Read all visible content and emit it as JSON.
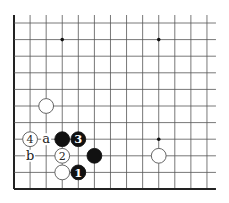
{
  "diagram": {
    "type": "go-board-diagram",
    "grid": {
      "columns": 13,
      "rows": 11,
      "x0": 14,
      "y0": 23,
      "dx": 16.08,
      "dy": 16.6,
      "line_color": "#555555",
      "edge_color": "#222222",
      "edges": {
        "left": true,
        "bottom": true,
        "top": false,
        "right": false
      }
    },
    "star_points": [
      {
        "col": 3,
        "row": 1
      },
      {
        "col": 9,
        "row": 1
      },
      {
        "col": 9,
        "row": 7
      }
    ],
    "stones": [
      {
        "color": "white",
        "col": 2,
        "row": 5,
        "label": ""
      },
      {
        "color": "white",
        "col": 1,
        "row": 7,
        "label": "4"
      },
      {
        "color": "black",
        "col": 3,
        "row": 7,
        "label": ""
      },
      {
        "color": "black",
        "col": 4,
        "row": 7,
        "label": "3"
      },
      {
        "color": "white",
        "col": 3,
        "row": 8,
        "label": "2"
      },
      {
        "color": "black",
        "col": 5,
        "row": 8,
        "label": ""
      },
      {
        "color": "white",
        "col": 9,
        "row": 8,
        "label": ""
      },
      {
        "color": "white",
        "col": 3,
        "row": 9,
        "label": ""
      },
      {
        "color": "black",
        "col": 4,
        "row": 9,
        "label": "1"
      }
    ],
    "markers": [
      {
        "text": "a",
        "col": 2,
        "row": 7
      },
      {
        "text": "b",
        "col": 1,
        "row": 8
      }
    ],
    "colors": {
      "black_stone": "#111111",
      "white_stone": "#ffffff",
      "stone_outline": "#555555"
    }
  }
}
